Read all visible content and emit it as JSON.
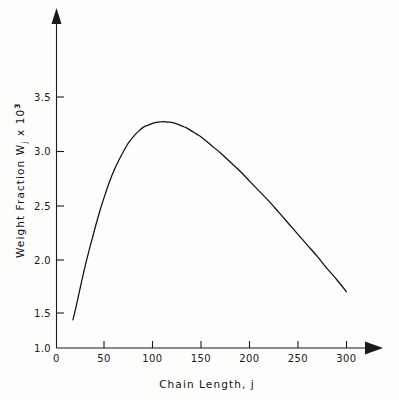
{
  "chart_data": {
    "type": "line",
    "title": "",
    "xlabel": "Chain Length, j",
    "ylabel_parts": {
      "main": "Weight Fraction W",
      "sub": "j",
      "mid": " x 10",
      "sup": "3"
    },
    "ylabel": "Weight Fraction W_j x 10^3",
    "xlim": [
      0,
      320
    ],
    "ylim": [
      1.0,
      3.8
    ],
    "grid": false,
    "legend": null,
    "xticks": [
      0,
      50,
      100,
      150,
      200,
      250,
      300
    ],
    "xtick_labels": [
      "0",
      "50",
      "100",
      "150",
      "200",
      "250",
      "300"
    ],
    "yticks": [
      1.0,
      1.5,
      2.0,
      2.5,
      3.0,
      3.5
    ],
    "ytick_labels": [
      "1.0",
      "1.5",
      "2.0",
      "2.5",
      "3.0",
      "3.5"
    ],
    "series": [
      {
        "name": "Weight fraction distribution",
        "x": [
          17,
          20,
          25,
          30,
          35,
          40,
          45,
          50,
          55,
          60,
          65,
          70,
          75,
          80,
          85,
          90,
          95,
          100,
          105,
          110,
          115,
          120,
          125,
          130,
          135,
          140,
          145,
          150,
          160,
          170,
          180,
          190,
          200,
          210,
          220,
          230,
          240,
          250,
          260,
          270,
          280,
          290,
          300
        ],
        "y": [
          1.28,
          1.4,
          1.62,
          1.83,
          2.02,
          2.2,
          2.37,
          2.52,
          2.66,
          2.78,
          2.88,
          2.97,
          3.05,
          3.11,
          3.16,
          3.2,
          3.22,
          3.24,
          3.25,
          3.255,
          3.25,
          3.245,
          3.23,
          3.21,
          3.19,
          3.16,
          3.13,
          3.1,
          3.02,
          2.94,
          2.85,
          2.76,
          2.66,
          2.56,
          2.46,
          2.35,
          2.24,
          2.13,
          2.02,
          1.91,
          1.79,
          1.68,
          1.56
        ]
      }
    ],
    "annotations": {
      "peak_x": 113,
      "peak_y": 3.26,
      "curve_start": {
        "x": 17,
        "y": 1.28
      },
      "curve_end": {
        "x": 300,
        "y": 1.56
      }
    },
    "axis_style": {
      "x_arrow": true,
      "y_arrow": true,
      "line_color": "#1a1a1a",
      "curve_color": "#101010",
      "background": "#fdfdfb"
    }
  }
}
